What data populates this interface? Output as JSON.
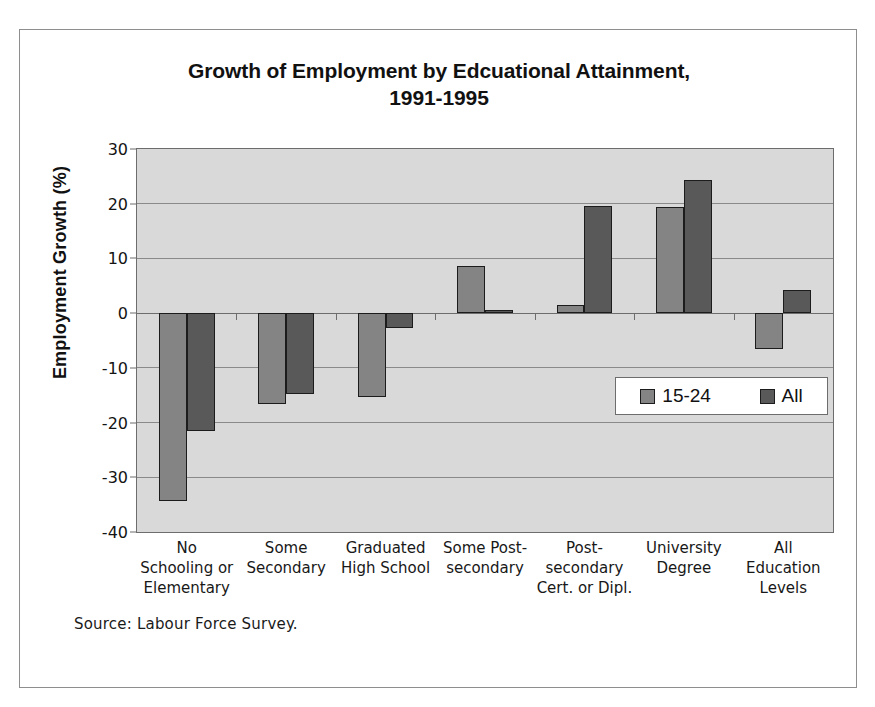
{
  "chart_data": {
    "type": "bar",
    "title": "Growth of Employment by Edcuational Attainment, 1991-1995",
    "title_line1": "Growth of Employment by Edcuational Attainment,",
    "title_line2": "1991-1995",
    "xlabel": "",
    "ylabel": "Employment Growth (%)",
    "ylim": [
      -40,
      30
    ],
    "ytick_step": 10,
    "yticks": [
      30,
      20,
      10,
      0,
      -10,
      -20,
      -30,
      -40
    ],
    "ytick_labels": [
      "30",
      "20",
      "10",
      "0",
      "-10",
      "-20",
      "-30",
      "-40"
    ],
    "grid": true,
    "legend_position": "bottom-right",
    "categories": [
      "No Schooling or Elementary",
      "Some Secondary",
      "Graduated High School",
      "Some Post-secondary",
      "Post-secondary Cert. or Dipl.",
      "University Degree",
      "All Education Levels"
    ],
    "category_label_lines": [
      [
        "No",
        "Schooling or",
        "Elementary"
      ],
      [
        "Some",
        "Secondary"
      ],
      [
        "Graduated",
        "High School"
      ],
      [
        "Some Post-",
        "secondary"
      ],
      [
        "Post-",
        "secondary",
        "Cert. or Dipl."
      ],
      [
        "University",
        "Degree"
      ],
      [
        "All",
        "Education",
        "Levels"
      ]
    ],
    "series": [
      {
        "name": "15-24",
        "color": "#848484",
        "values": [
          -34.3,
          -16.6,
          -15.4,
          8.6,
          1.5,
          19.4,
          -6.6
        ]
      },
      {
        "name": "All",
        "color": "#595959",
        "values": [
          -21.5,
          -14.8,
          -2.8,
          0.6,
          19.5,
          24.4,
          4.2
        ]
      }
    ],
    "source_note": "Source:  Labour Force Survey.",
    "plot_background": "#d9d9d9",
    "axis_color": "#6d6d6d"
  }
}
